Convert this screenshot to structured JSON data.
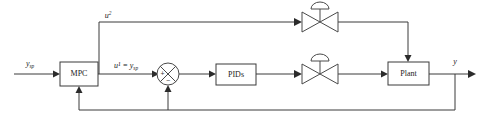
{
  "diagram": {
    "background_color": "#ffffff",
    "line_color": "#3a3a3a",
    "text_color": "#1a1a1a",
    "blocks": [
      {
        "id": "mpc",
        "label": "MPC",
        "x": 60,
        "y": 62,
        "w": 38,
        "h": 24
      },
      {
        "id": "pids",
        "label": "PIDs",
        "x": 216,
        "y": 64,
        "w": 40,
        "h": 21
      },
      {
        "id": "plant",
        "label": "Plant",
        "x": 388,
        "y": 62,
        "w": 41,
        "h": 23
      }
    ],
    "valves": [
      {
        "id": "valve-upper",
        "cx": 320,
        "cy": 19,
        "label": "control-valve"
      },
      {
        "id": "valve-lower",
        "cx": 320,
        "cy": 74,
        "label": "control-valve"
      }
    ],
    "summing_junction": {
      "id": "sum",
      "cx": 168,
      "cy": 74,
      "r": 11,
      "plus_sign": "+",
      "minus_sign": "−",
      "plus_position": "left",
      "minus_position": "bottom"
    },
    "signals": {
      "setpoint_in": {
        "base": "y",
        "sub": "sp",
        "sup": "",
        "x": 32,
        "y": 64
      },
      "u2": {
        "base": "u",
        "sub": "",
        "sup": "2",
        "x": 108,
        "y": 18
      },
      "u1_eq": {
        "text": "u¹ = y",
        "sub": "sp",
        "x": 128,
        "y": 68
      },
      "output_y": {
        "base": "y",
        "sub": "",
        "sup": "",
        "x": 455,
        "y": 62
      }
    },
    "connections": [
      "setpoint -> MPC input (left)",
      "MPC output -> branch node",
      "branch node -> up -> right -> upper valve (u2)",
      "branch node -> right -> summing junction + input (u1 = y_sp)",
      "summing junction -> PIDs",
      "PIDs -> lower control valve",
      "lower control valve -> Plant left input",
      "upper control valve -> right -> down -> Plant top input",
      "Plant -> y output (right arrow)",
      "y tap -> down -> feedback bus -> up to summing junction minus input",
      "feedback bus -> up to MPC bottom input"
    ]
  }
}
